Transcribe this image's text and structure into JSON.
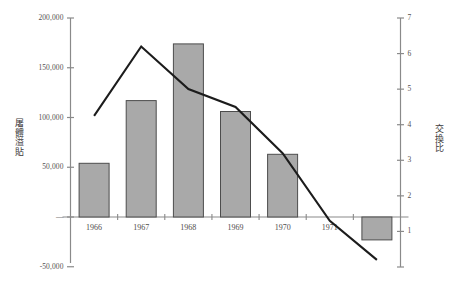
{
  "chart_data": {
    "type": "bar",
    "title": "",
    "subtitle": "",
    "categories": [
      "1966",
      "1967",
      "1968",
      "1969",
      "1970",
      "1971",
      "1972"
    ],
    "series": [
      {
        "name": "屠體溢貼",
        "type": "bar",
        "axis": "left",
        "values": [
          54000,
          117000,
          174000,
          106000,
          63000,
          0,
          -23000
        ]
      },
      {
        "name": "交換比",
        "type": "line",
        "axis": "right",
        "values": [
          4.25,
          6.2,
          5.0,
          4.5,
          3.2,
          1.3,
          0.2
        ]
      }
    ],
    "xlabel": "",
    "ylabel": "屠體溢貼",
    "y2label": "交換比",
    "ylim": [
      -50000,
      200000
    ],
    "y2lim": [
      0,
      7
    ],
    "yticks": [
      "200,000",
      "150,000",
      "100,000",
      "50,000",
      "—",
      "-50,000"
    ],
    "ytick_values": [
      200000,
      150000,
      100000,
      50000,
      0,
      -50000
    ],
    "y2ticks": [
      "7",
      "6",
      "5",
      "4",
      "3",
      "2",
      "1",
      ""
    ],
    "y2tick_values": [
      7,
      6,
      5,
      4,
      3,
      2,
      1,
      0
    ],
    "grid": false,
    "legend": "none",
    "bar_color": "#a9a9a9",
    "bar_border_color": "#4d4d4d",
    "line_color": "#1c1c1c",
    "axis_color": "#8a8a8a"
  },
  "axes": {
    "left_title": "屠體溢貼",
    "right_title": "交換比"
  }
}
